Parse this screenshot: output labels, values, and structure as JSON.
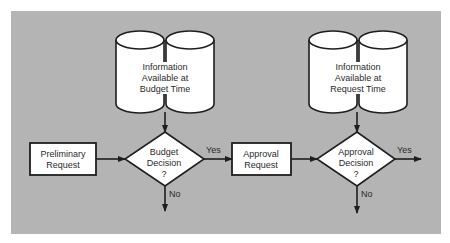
{
  "colors": {
    "background": "#ffffff",
    "panel": "#b4b4b4",
    "shape_fill": "#ffffff",
    "stroke": "#1e1e1e",
    "text": "#2a2a2a"
  },
  "diagram": {
    "type": "flowchart",
    "nodes": {
      "info_budget": {
        "kind": "data-store",
        "lines": [
          "Information",
          "Available at",
          "Budget Time"
        ]
      },
      "info_request": {
        "kind": "data-store",
        "lines": [
          "Information",
          "Available at",
          "Request Time"
        ]
      },
      "preliminary_request": {
        "kind": "process",
        "lines": [
          "Preliminary",
          "Request"
        ]
      },
      "budget_decision": {
        "kind": "decision",
        "lines": [
          "Budget",
          "Decision",
          "?"
        ]
      },
      "approval_request": {
        "kind": "process",
        "lines": [
          "Approval",
          "Request"
        ]
      },
      "approval_decision": {
        "kind": "decision",
        "lines": [
          "Approval",
          "Decision",
          "?"
        ]
      }
    },
    "edges": {
      "budget_yes": "Yes",
      "budget_no": "No",
      "approval_yes": "Yes",
      "approval_no": "No"
    }
  }
}
